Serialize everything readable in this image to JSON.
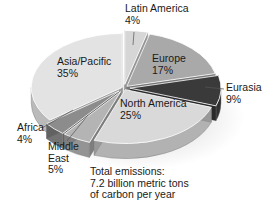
{
  "chart_data": {
    "type": "pie",
    "title": "",
    "style": "3d-exploded",
    "categories": [
      "Latin America",
      "Europe",
      "Eurasia",
      "North America",
      "Middle East",
      "Africa",
      "Asia/Pacific"
    ],
    "values": [
      4,
      17,
      9,
      25,
      5,
      4,
      35
    ],
    "unit": "%",
    "colors": [
      "#d6d6d6",
      "#a9a9a9",
      "#3a3a3a",
      "#d9d9d9",
      "#b4b4b4",
      "#8c8c8c",
      "#e3e3e3"
    ],
    "annotation": [
      "Total emissions:",
      "7.2 billion metric tons",
      "of carbon per year"
    ]
  },
  "labels": [
    {
      "name": "Latin America",
      "pct": "4%"
    },
    {
      "name": "Europe",
      "pct": "17%"
    },
    {
      "name": "Eurasia",
      "pct": "9%"
    },
    {
      "name": "North America",
      "pct": "25%"
    },
    {
      "name": "Middle",
      "name2": "East",
      "pct": "5%"
    },
    {
      "name": "Africa",
      "pct": "4%"
    },
    {
      "name": "Asia/Pacific",
      "pct": "35%"
    }
  ],
  "note": {
    "line1": "Total emissions:",
    "line2": "7.2 billion metric tons",
    "line3": "of carbon per year"
  }
}
